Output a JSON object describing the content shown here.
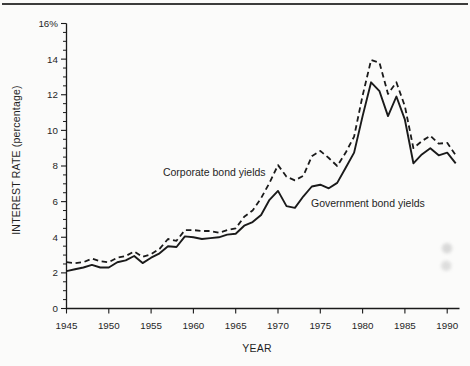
{
  "figure": {
    "background": "#fbfbfa",
    "top_rule_color": "#3c3c3c",
    "line_color": "#1a1a1a",
    "text_color": "#1f1f1f"
  },
  "chart_data": {
    "type": "line",
    "title": "",
    "xlabel": "YEAR",
    "ylabel": "INTEREST RATE (percentage)",
    "xlim": [
      1945,
      1991.5
    ],
    "ylim": [
      0,
      16
    ],
    "grid": false,
    "legend_position": "inline-annotations",
    "x_ticks": [
      1945,
      1950,
      1955,
      1960,
      1965,
      1970,
      1975,
      1980,
      1985,
      1990
    ],
    "y_ticks": [
      0,
      2,
      4,
      6,
      8,
      10,
      12,
      14,
      16
    ],
    "y_tick_labels": [
      "0",
      "2",
      "4",
      "6",
      "8",
      "10",
      "12",
      "14",
      "16%"
    ],
    "y_minor_tick_step": 0.5,
    "years": [
      1945,
      1946,
      1947,
      1948,
      1949,
      1950,
      1951,
      1952,
      1953,
      1954,
      1955,
      1956,
      1957,
      1958,
      1959,
      1960,
      1961,
      1962,
      1963,
      1964,
      1965,
      1966,
      1967,
      1968,
      1969,
      1970,
      1971,
      1972,
      1973,
      1974,
      1975,
      1976,
      1977,
      1978,
      1979,
      1980,
      1981,
      1982,
      1983,
      1984,
      1985,
      1986,
      1987,
      1988,
      1989,
      1990,
      1991
    ],
    "series": [
      {
        "name": "Corporate bond yields",
        "line_style": "dashed",
        "values": [
          2.6,
          2.55,
          2.6,
          2.8,
          2.65,
          2.6,
          2.85,
          2.95,
          3.2,
          2.9,
          3.05,
          3.35,
          3.9,
          3.8,
          4.4,
          4.4,
          4.35,
          4.35,
          4.25,
          4.4,
          4.5,
          5.15,
          5.5,
          6.2,
          7.05,
          8.05,
          7.4,
          7.2,
          7.45,
          8.55,
          8.85,
          8.45,
          8.0,
          8.75,
          9.65,
          11.95,
          13.95,
          13.8,
          12.05,
          12.7,
          11.35,
          9.0,
          9.4,
          9.7,
          9.25,
          9.3,
          8.6
        ]
      },
      {
        "name": "Government bond yields",
        "line_style": "solid",
        "values": [
          2.1,
          2.2,
          2.3,
          2.45,
          2.3,
          2.3,
          2.6,
          2.7,
          2.95,
          2.55,
          2.85,
          3.1,
          3.5,
          3.45,
          4.05,
          4.0,
          3.9,
          3.95,
          4.0,
          4.15,
          4.2,
          4.65,
          4.85,
          5.25,
          6.1,
          6.6,
          5.75,
          5.65,
          6.3,
          6.85,
          6.95,
          6.75,
          7.05,
          7.9,
          8.75,
          10.8,
          12.7,
          12.2,
          10.8,
          11.9,
          10.6,
          8.15,
          8.65,
          9.0,
          8.6,
          8.75,
          8.15
        ]
      }
    ],
    "annotations": [
      {
        "text": "Corporate bond yields",
        "year": 1956.4,
        "value": 7.45,
        "anchor": "start"
      },
      {
        "text": "Government bond yields",
        "year": 1973.9,
        "value": 5.72,
        "anchor": "start"
      }
    ]
  }
}
